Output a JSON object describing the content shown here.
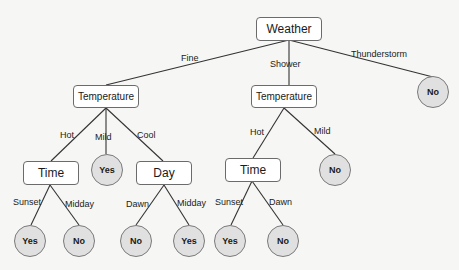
{
  "diagram": {
    "type": "decision-tree",
    "root": {
      "label": "Weather",
      "branches": [
        {
          "edge": "Fine",
          "node": {
            "label": "Temperature",
            "branches": [
              {
                "edge": "Hot",
                "node": {
                  "label": "Time",
                  "branches": [
                    {
                      "edge": "Sunset",
                      "leaf": "Yes"
                    },
                    {
                      "edge": "Midday",
                      "leaf": "No"
                    }
                  ]
                }
              },
              {
                "edge": "Mild",
                "leaf": "Yes"
              },
              {
                "edge": "Cool",
                "node": {
                  "label": "Day",
                  "branches": [
                    {
                      "edge": "Dawn",
                      "leaf": "No"
                    },
                    {
                      "edge": "Midday",
                      "leaf": "Yes"
                    }
                  ]
                }
              }
            ]
          }
        },
        {
          "edge": "Shower",
          "node": {
            "label": "Temperature",
            "branches": [
              {
                "edge": "Hot",
                "node": {
                  "label": "Time",
                  "branches": [
                    {
                      "edge": "Sunset",
                      "leaf": "Yes"
                    },
                    {
                      "edge": "Dawn",
                      "leaf": "No"
                    }
                  ]
                }
              },
              {
                "edge": "Mild",
                "leaf": "No"
              }
            ]
          }
        },
        {
          "edge": "Thunderstorm",
          "leaf": "No"
        }
      ]
    }
  },
  "nodes": {
    "weather": "Weather",
    "temp_fine": "Temperature",
    "temp_shower": "Temperature",
    "time_fine": "Time",
    "day_fine": "Day",
    "time_shower": "Time"
  },
  "leaves": {
    "thunderstorm": "No",
    "fine_mild": "Yes",
    "shower_mild": "No",
    "fine_hot_sunset": "Yes",
    "fine_hot_midday": "No",
    "fine_cool_dawn": "No",
    "fine_cool_midday": "Yes",
    "shower_hot_sunset": "Yes",
    "shower_hot_dawn": "No"
  },
  "edges": {
    "fine": "Fine",
    "shower": "Shower",
    "thunderstorm": "Thunderstorm",
    "fine_hot": "Hot",
    "fine_mild": "Mild",
    "fine_cool": "Cool",
    "shower_hot": "Hot",
    "shower_mild": "Mild",
    "fine_hot_sunset": "Sunset",
    "fine_hot_midday": "Midday",
    "fine_cool_dawn": "Dawn",
    "fine_cool_midday": "Midday",
    "shower_hot_sunset": "Sunset",
    "shower_hot_dawn": "Dawn"
  },
  "colors": {
    "leaf_fill": "#e0e0e0",
    "box_fill": "#ffffff",
    "edge_stroke": "#333333",
    "background": "#f6f6f4"
  }
}
